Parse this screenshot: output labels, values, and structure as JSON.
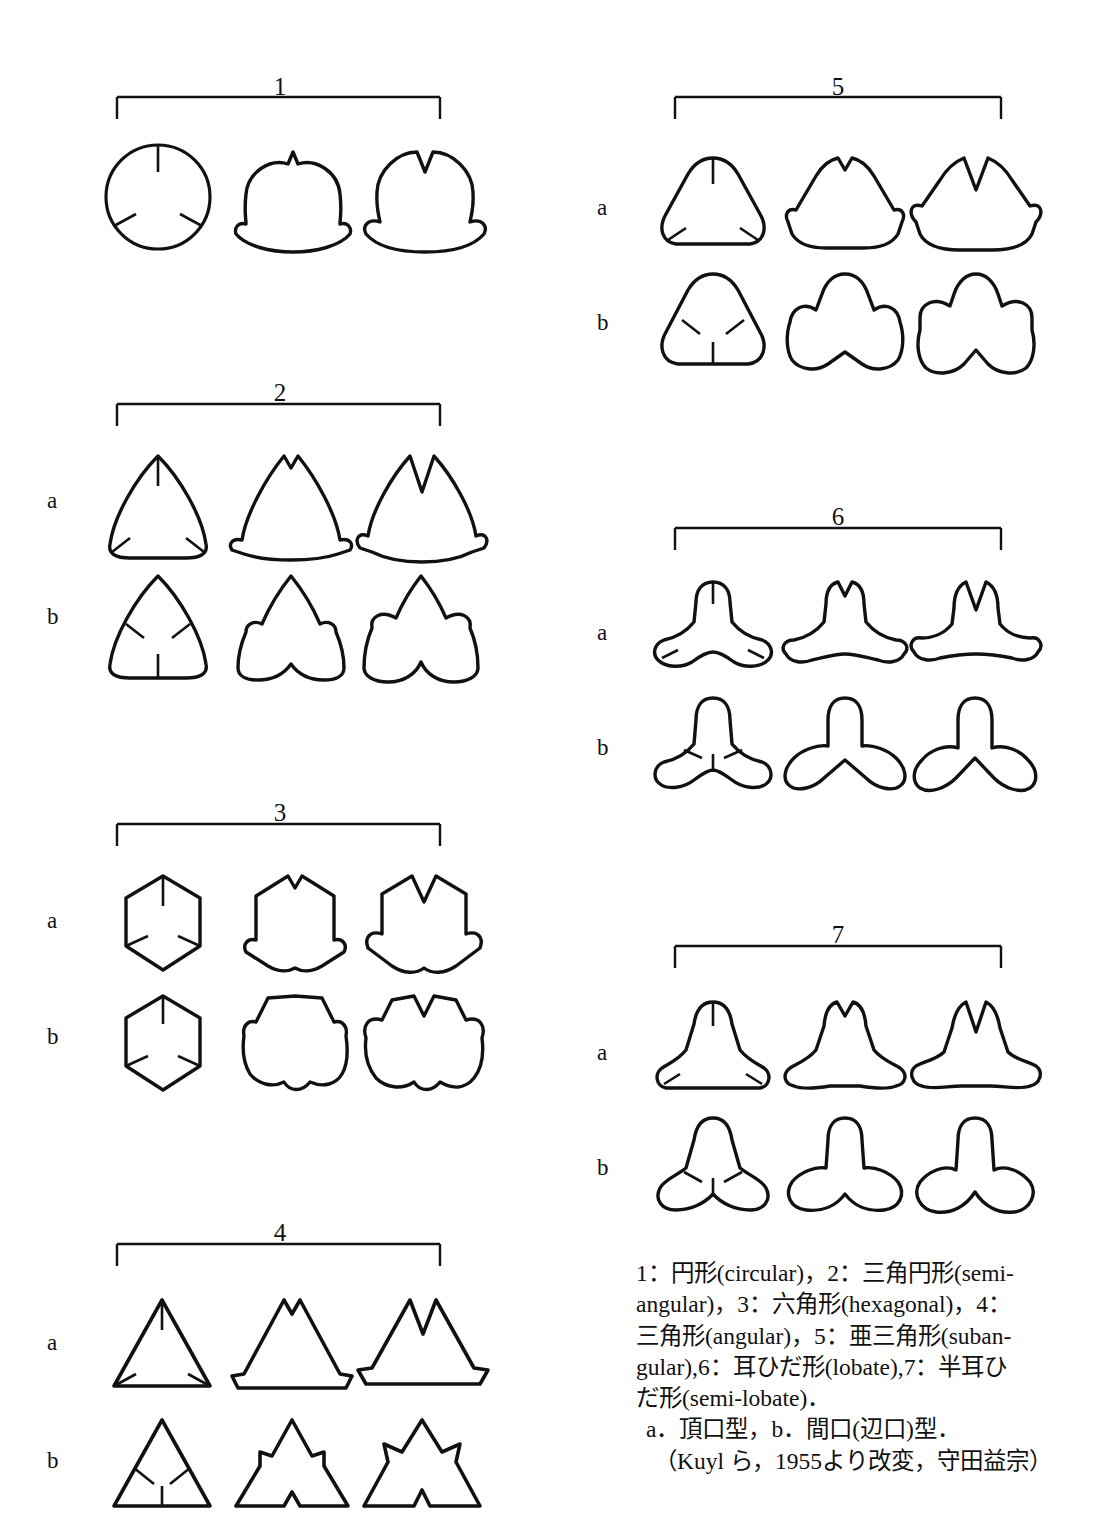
{
  "figure": {
    "kind": "pollen-aperture-shape-classification-plate",
    "groups": [
      {
        "number": "1",
        "name_ja": "円形",
        "name_en": "circular",
        "rows": [
          "",
          ""
        ],
        "single_row": true,
        "variants": 3
      },
      {
        "number": "2",
        "name_ja": "三角円形",
        "name_en": "semi-angular",
        "rows": [
          "a",
          "b"
        ],
        "single_row": false,
        "variants": 3
      },
      {
        "number": "3",
        "name_ja": "六角形",
        "name_en": "hexagonal",
        "rows": [
          "a",
          "b"
        ],
        "single_row": false,
        "variants": 3
      },
      {
        "number": "4",
        "name_ja": "三角形",
        "name_en": "angular",
        "rows": [
          "a",
          "b"
        ],
        "single_row": false,
        "variants": 3
      },
      {
        "number": "5",
        "name_ja": "亜三角形",
        "name_en": "subangular",
        "rows": [
          "a",
          "b"
        ],
        "single_row": false,
        "variants": 3
      },
      {
        "number": "6",
        "name_ja": "耳ひだ形",
        "name_en": "lobate",
        "rows": [
          "a",
          "b"
        ],
        "single_row": false,
        "variants": 3
      },
      {
        "number": "7",
        "name_ja": "半耳ひだ形",
        "name_en": "semi-lobate",
        "rows": [
          "a",
          "b"
        ],
        "single_row": false,
        "variants": 3
      }
    ],
    "row_labels": {
      "a": "a",
      "b": "b"
    }
  },
  "caption": {
    "line1": "1：円形(circular)，2：三角円形(semi-",
    "line2": "angular)，3：六角形(hexagonal)，4：",
    "line3": "三角形(angular)，5：亜三角形(suban-",
    "line4": "gular),6：耳ひだ形(lobate),7：半耳ひ",
    "line5": "だ形(semi-lobate)．",
    "line6": "a．頂口型，b．間口(辺口)型．",
    "line7": "（Kuyl ら，1955より改変，守田益宗）"
  },
  "colors": {
    "ink": "#111111",
    "paper": "#ffffff"
  }
}
